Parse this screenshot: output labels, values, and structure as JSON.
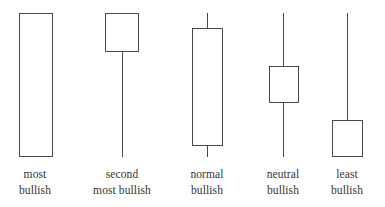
{
  "figure": {
    "title": "",
    "background_color": "#ffffff",
    "line_color": "#4a4a4a",
    "text_color": "#333333",
    "body_fill": "#ffffff"
  },
  "chart_data": {
    "type": "candlestick",
    "title": "",
    "xlabel": "",
    "ylabel": "",
    "grid": false,
    "legend": "none",
    "axis_hidden": true,
    "price_scale": {
      "top_pixel": 13,
      "bottom_pixel": 157,
      "note": "all candles share the same high at top and low at bottom"
    },
    "categories": [
      "most bullish",
      "second most bullish",
      "normal bullish",
      "neutral bullish",
      "least bullish"
    ],
    "candles": [
      {
        "index": 0,
        "label_line1": "most",
        "label_line2": "bullish",
        "center_x": 35,
        "body_left": 19,
        "body_width": 34,
        "body_top": 13,
        "body_bottom": 157,
        "upper_wick_top": 13,
        "lower_wick_bottom": 157,
        "has_upper_wick": false,
        "has_lower_wick": false,
        "open": 0,
        "close": 100,
        "high": 100,
        "low": 0,
        "body_fraction": 1.0,
        "direction": "bullish"
      },
      {
        "index": 1,
        "label_line1": "second",
        "label_line2": "most bullish",
        "center_x": 122,
        "body_left": 105,
        "body_width": 34,
        "body_top": 13,
        "body_bottom": 52,
        "upper_wick_top": 13,
        "lower_wick_bottom": 157,
        "has_upper_wick": false,
        "has_lower_wick": true,
        "open": 73,
        "close": 100,
        "high": 100,
        "low": 0,
        "body_fraction": 0.27,
        "direction": "bullish"
      },
      {
        "index": 2,
        "label_line1": "normal",
        "label_line2": "bullish",
        "center_x": 207,
        "body_left": 192,
        "body_width": 31,
        "body_top": 28,
        "body_bottom": 146,
        "upper_wick_top": 13,
        "lower_wick_bottom": 157,
        "has_upper_wick": true,
        "has_lower_wick": true,
        "open": 8,
        "close": 90,
        "high": 100,
        "low": 0,
        "body_fraction": 0.82,
        "direction": "bullish"
      },
      {
        "index": 3,
        "label_line1": "neutral",
        "label_line2": "bullish",
        "center_x": 283,
        "body_left": 269,
        "body_width": 30,
        "body_top": 66,
        "body_bottom": 103,
        "upper_wick_top": 13,
        "lower_wick_bottom": 157,
        "has_upper_wick": true,
        "has_lower_wick": true,
        "open": 38,
        "close": 63,
        "high": 100,
        "low": 0,
        "body_fraction": 0.26,
        "direction": "bullish"
      },
      {
        "index": 4,
        "label_line1": "least",
        "label_line2": "bullish",
        "center_x": 347,
        "body_left": 332,
        "body_width": 31,
        "body_top": 120,
        "body_bottom": 157,
        "upper_wick_top": 13,
        "lower_wick_bottom": 157,
        "has_upper_wick": true,
        "has_lower_wick": false,
        "open": 0,
        "close": 26,
        "high": 100,
        "low": 0,
        "body_fraction": 0.26,
        "direction": "bullish"
      }
    ]
  }
}
